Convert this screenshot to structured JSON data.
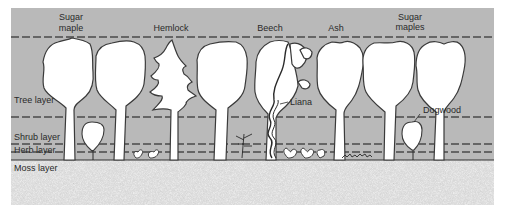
{
  "colors": {
    "sky": "#b9b9b9",
    "tree_fill": "#ffffff",
    "outline": "#3a3a3a",
    "ground": "#d2d2d2",
    "dash": "#4a4a4a"
  },
  "species_labels": [
    {
      "line1": "Sugar",
      "line2": "maple"
    },
    {
      "line1": "Hemlock",
      "line2": ""
    },
    {
      "line1": "Beech",
      "line2": ""
    },
    {
      "line1": "Ash",
      "line2": ""
    },
    {
      "line1": "Sugar",
      "line2": "maples"
    }
  ],
  "layers": [
    {
      "label": "Tree layer"
    },
    {
      "label": "Shrub layer"
    },
    {
      "label": "Herb layer"
    },
    {
      "label": "Moss layer"
    }
  ],
  "callouts": {
    "liana": "Liana",
    "dogwood": "Dogwood"
  }
}
